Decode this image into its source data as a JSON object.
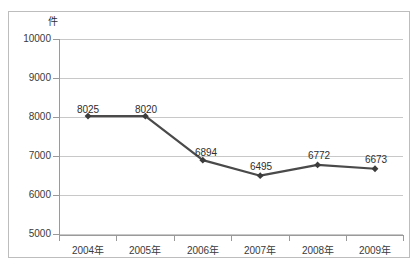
{
  "chart_data": {
    "type": "line",
    "title": "",
    "xlabel": "",
    "ylabel": "件",
    "unit_label": "件",
    "categories": [
      "2004年",
      "2005年",
      "2006年",
      "2007年",
      "2008年",
      "2009年"
    ],
    "values": [
      8025,
      8020,
      6894,
      6495,
      6772,
      6673
    ],
    "point_labels": [
      "8025",
      "8020",
      "6894",
      "6495",
      "6772",
      "6673"
    ],
    "series": [
      {
        "name": "",
        "values": [
          8025,
          8020,
          6894,
          6495,
          6772,
          6673
        ],
        "color": "#4a4a4a",
        "marker": "diamond"
      }
    ],
    "ylim": [
      5000,
      10000
    ],
    "yticks": [
      10000,
      9000,
      8000,
      7000,
      6000,
      5000
    ],
    "ytick_labels": [
      "10000",
      "9000",
      "8000",
      "7000",
      "6000",
      "5000"
    ],
    "grid": true,
    "legend": "none",
    "colors": {
      "line": "#4a4a4a",
      "marker": "#3c3c3c",
      "gridline": "#c8c8c8",
      "axis": "#9a9a9a",
      "border": "#bdbdbd",
      "text": "#2e2e2e",
      "background": "#ffffff"
    }
  }
}
